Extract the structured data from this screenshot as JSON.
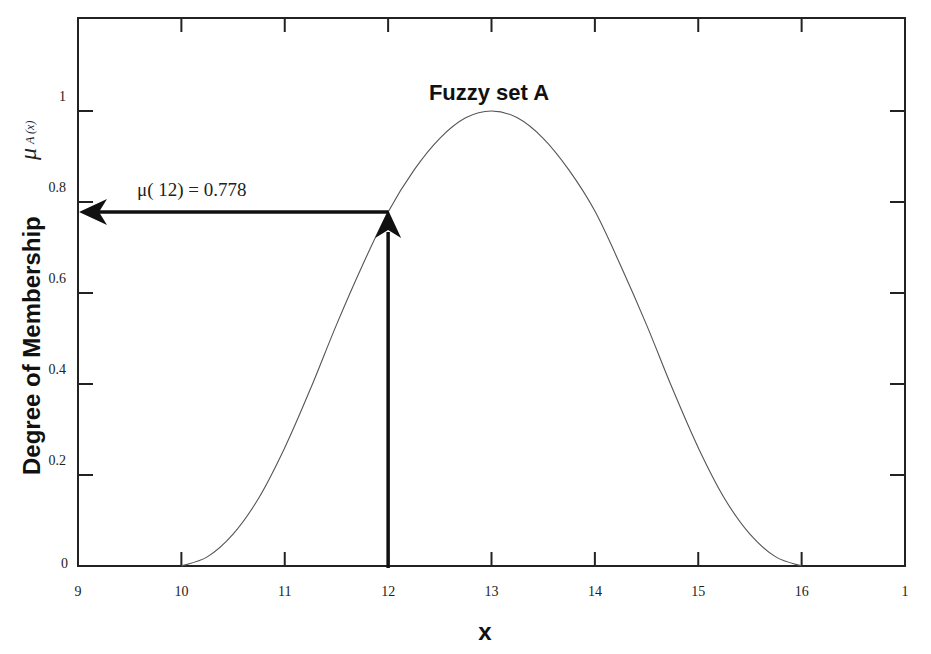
{
  "chart_data": {
    "type": "line",
    "title": "Fuzzy set  A",
    "xlabel": "x",
    "ylabel": "Degree of Membership",
    "ylabel_symbol": "μ",
    "ylabel_subscript": "A (x)",
    "xlim": [
      9,
      17
    ],
    "ylim": [
      0,
      1.2
    ],
    "x_ticks": [
      9,
      10,
      11,
      12,
      13,
      14,
      15,
      16,
      17
    ],
    "x_tick_labels": [
      "9",
      "10",
      "11",
      "12",
      "13",
      "14",
      "15",
      "16",
      "1"
    ],
    "y_ticks": [
      0,
      0.2,
      0.4,
      0.6,
      0.8,
      1
    ],
    "y_tick_labels": [
      "0",
      "0.2",
      "0.4",
      "0.6",
      "0.8",
      "1"
    ],
    "grid": false,
    "legend": null,
    "series": [
      {
        "name": "Fuzzy set A membership",
        "x": [
          10,
          10.25,
          10.5,
          10.75,
          11,
          11.25,
          11.5,
          11.75,
          12,
          12.25,
          12.5,
          12.75,
          13,
          13.25,
          13.5,
          13.75,
          14,
          14.25,
          14.5,
          14.75,
          15,
          15.25,
          15.5,
          15.75,
          16
        ],
        "y": [
          0,
          0.02,
          0.07,
          0.15,
          0.26,
          0.39,
          0.53,
          0.66,
          0.778,
          0.87,
          0.94,
          0.985,
          1,
          0.985,
          0.94,
          0.87,
          0.78,
          0.66,
          0.53,
          0.39,
          0.26,
          0.15,
          0.07,
          0.02,
          0
        ]
      }
    ],
    "annotations": [
      {
        "text": "μ( 12) = 0.778",
        "x": 12,
        "y": 0.778,
        "arrows": [
          {
            "from": [
              12,
              0
            ],
            "to": [
              12,
              0.778
            ],
            "direction": "up"
          },
          {
            "from": [
              12,
              0.778
            ],
            "to": [
              9,
              0.778
            ],
            "direction": "left"
          }
        ]
      }
    ]
  },
  "labels": {
    "title": "Fuzzy set  A",
    "xlabel": "x",
    "ylabel": "Degree of Membership",
    "mu_symbol": "μ",
    "mu_sub": "A (x)",
    "annotation": "μ( 12) = 0.778"
  }
}
